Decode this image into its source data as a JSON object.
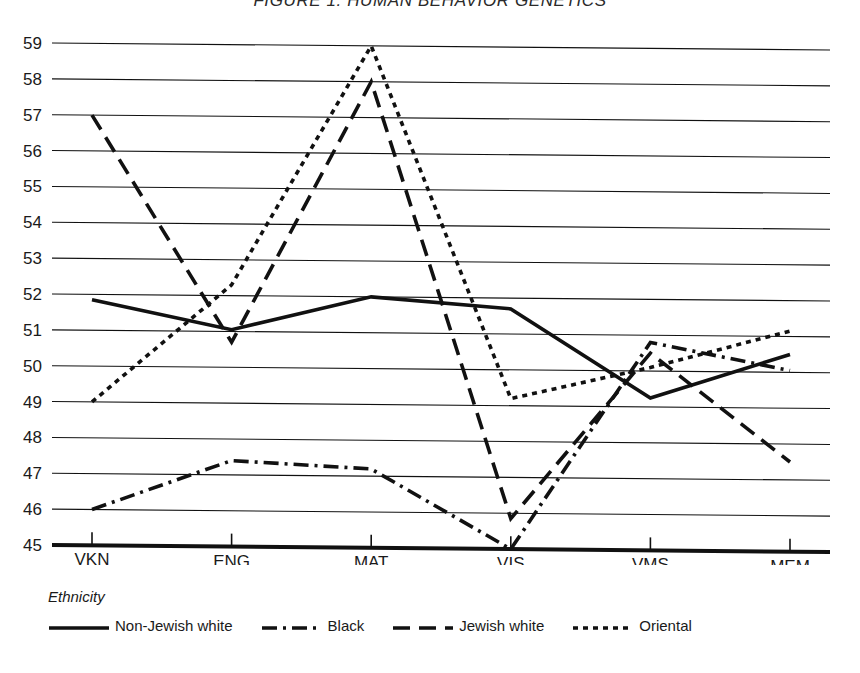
{
  "chart_data": {
    "type": "line",
    "title": "FIGURE 1.  HUMAN BEHAVIOR GENETICS",
    "xlabel": "",
    "ylabel": "",
    "categories": [
      "VKN",
      "ENG",
      "MAT",
      "VIS",
      "VMS",
      "MEM"
    ],
    "ylim": [
      45,
      59
    ],
    "ytick_labels": [
      "45",
      "46",
      "47",
      "48",
      "49",
      "50",
      "51",
      "52",
      "53",
      "54",
      "55",
      "56",
      "57",
      "58",
      "59"
    ],
    "ytick_values": [
      45,
      46,
      47,
      48,
      49,
      50,
      51,
      52,
      53,
      54,
      55,
      56,
      57,
      58,
      59
    ],
    "grid": true,
    "legend_position": "below",
    "legend_title": "Ethnicity",
    "series": [
      {
        "name": "Non-Jewish white",
        "dash": "solid",
        "values": [
          51.85,
          51.05,
          52.0,
          51.7,
          49.25,
          50.5
        ]
      },
      {
        "name": "Black",
        "dash": "dash-dot",
        "values": [
          46.0,
          47.4,
          47.2,
          45.0,
          50.8,
          50.05
        ]
      },
      {
        "name": "Jewish white",
        "dash": "dashed",
        "values": [
          57.0,
          50.7,
          58.0,
          45.85,
          50.5,
          47.5
        ]
      },
      {
        "name": "Oriental",
        "dash": "dotted",
        "values": [
          49.0,
          52.3,
          59.0,
          49.2,
          50.1,
          51.15
        ]
      }
    ]
  }
}
